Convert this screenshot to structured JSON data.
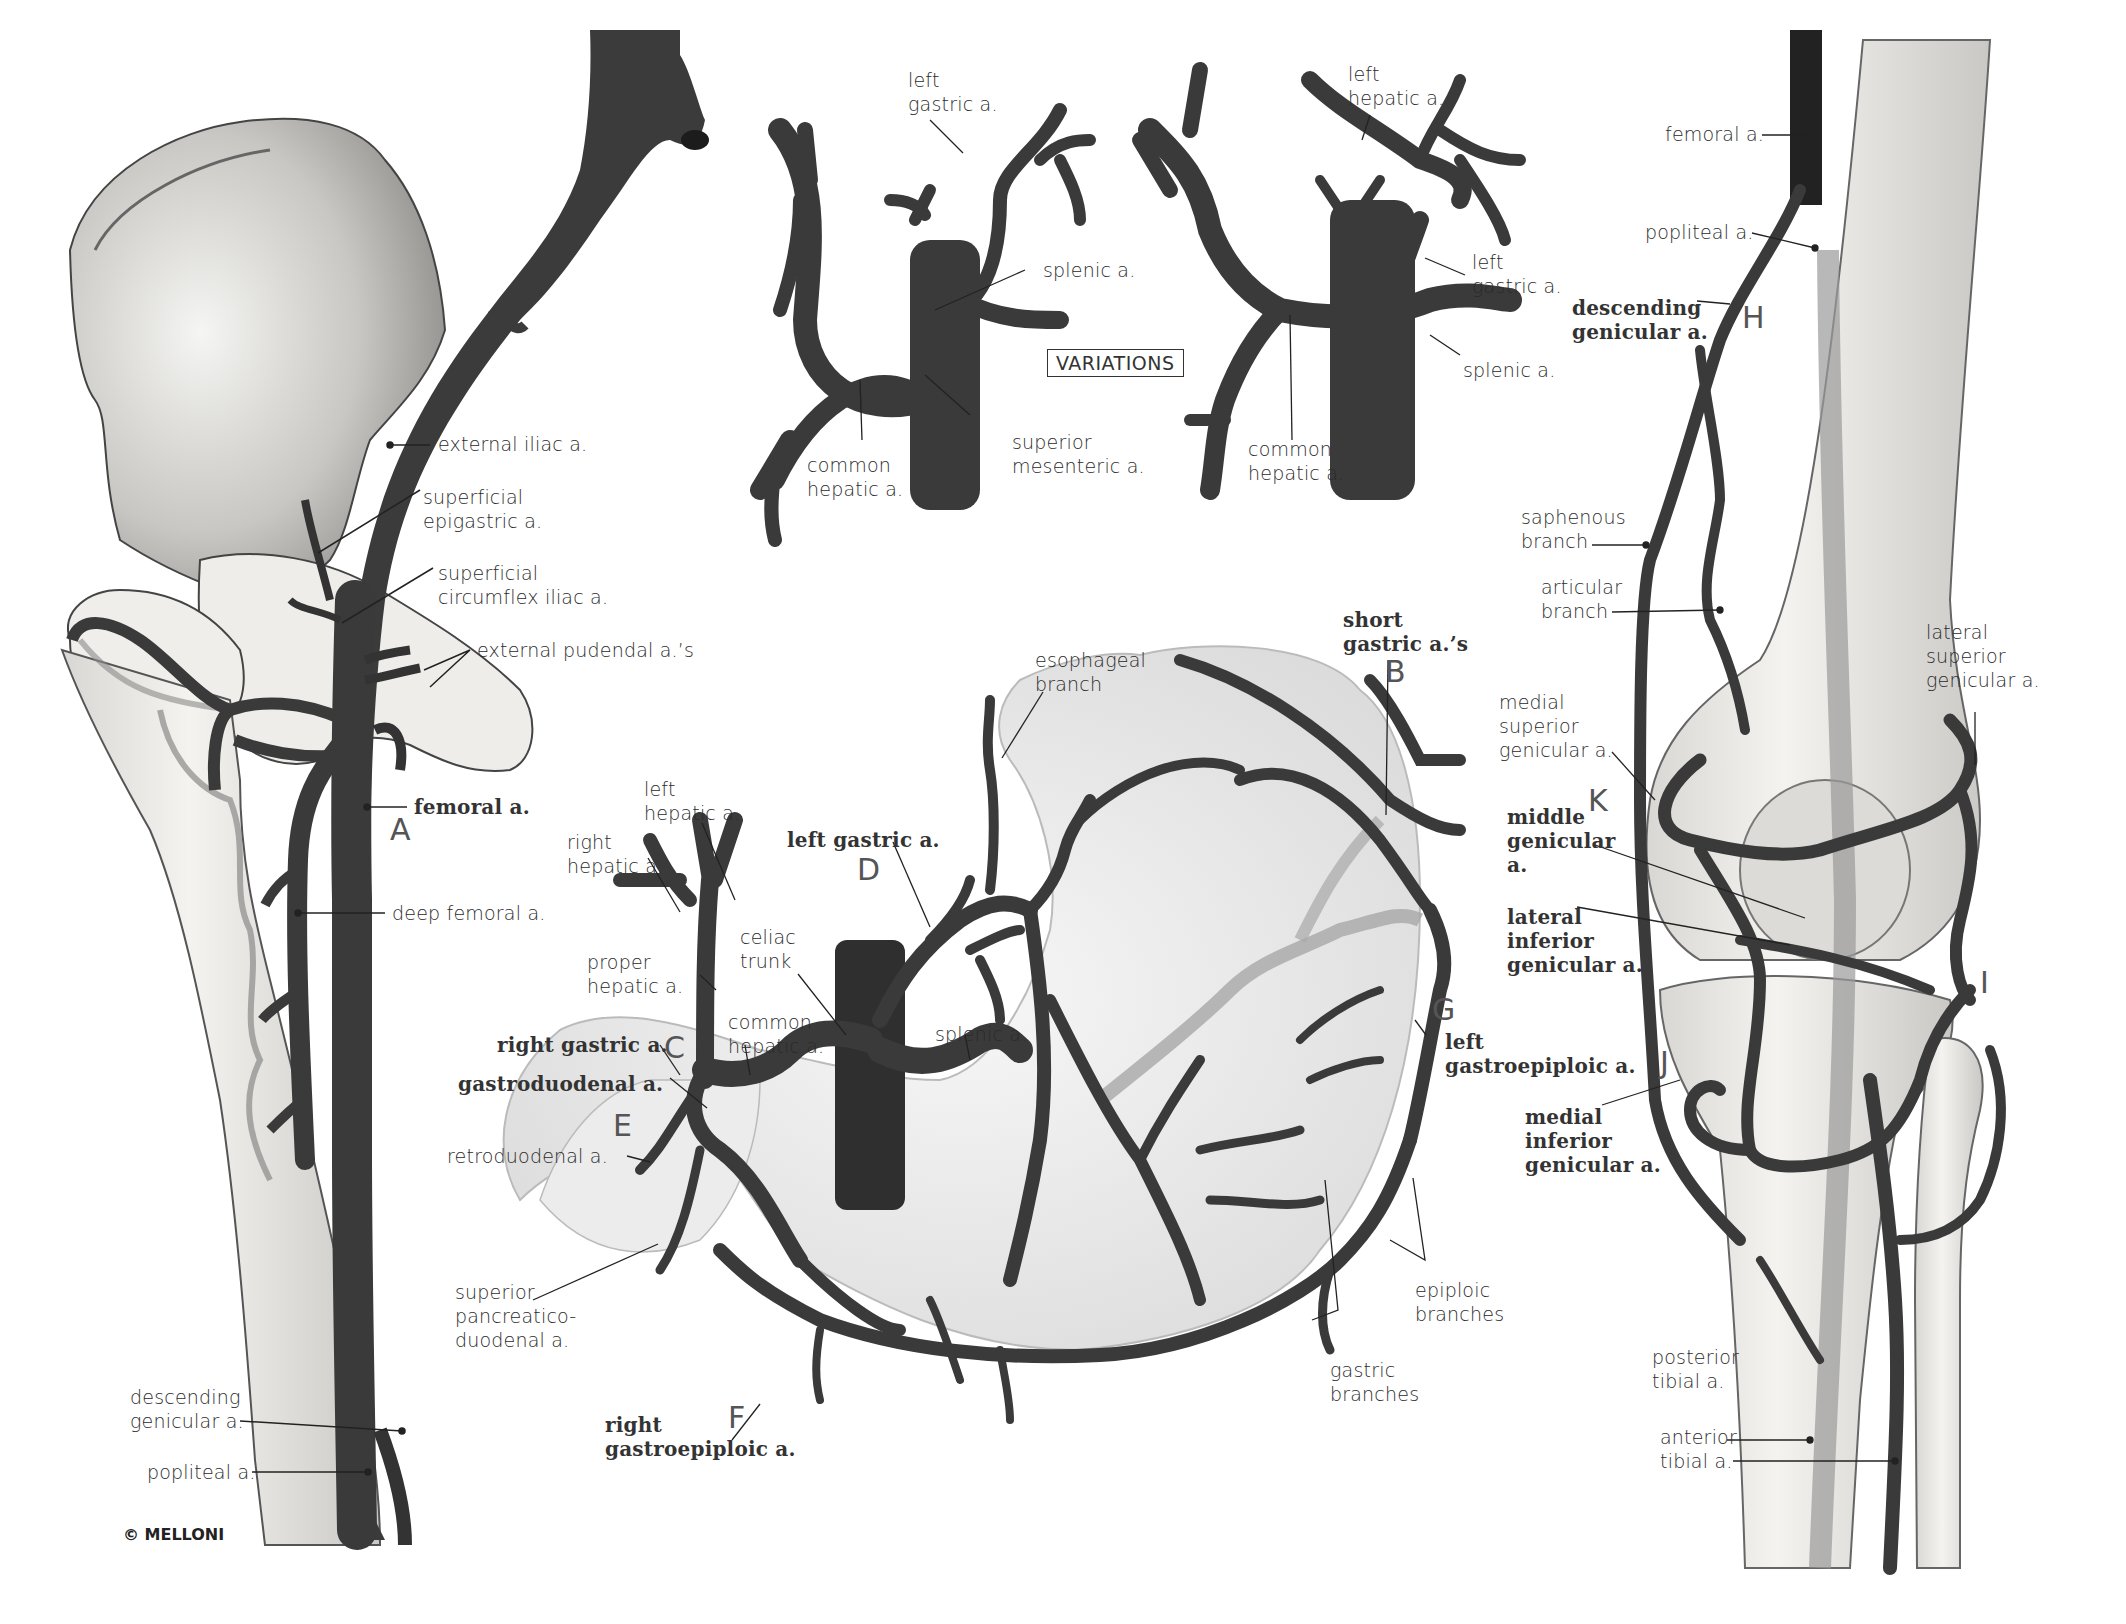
{
  "figure": {
    "copyright": "© MELLONI",
    "variations_label": "VARIATIONS",
    "colors": {
      "artery": "#3d3d3d",
      "artery_dark": "#262626",
      "bone": "#ecebe8",
      "bone_shade": "#b9b8b4",
      "organ": "#eeeeee",
      "faint_vessel": "#a8a8a8",
      "leader_line": "#222222",
      "text": "#2b2b2b",
      "letter": "#555555"
    }
  },
  "panels": {
    "hip_thigh": {
      "labels": {
        "external_iliac": "external iliac a.",
        "superficial_epigastric": "superficial\nepigastric a.",
        "superficial_circumflex_iliac": "superficial\ncircumflex iliac a.",
        "external_pudendal": "external pudendal a.’s",
        "femoral": "femoral a.",
        "deep_femoral": "deep femoral a.",
        "descending_genicular": "descending\ngenicular a.",
        "popliteal": "popliteal a."
      },
      "letters": {
        "A": "A"
      }
    },
    "variations": {
      "left_diagram": {
        "left_gastric": "left\ngastric a.",
        "splenic": "splenic a.",
        "common_hepatic": "common\nhepatic a.",
        "superior_mesenteric": "superior\nmesenteric a."
      },
      "right_diagram": {
        "left_hepatic": "left\nhepatic a.",
        "left_gastric": "left\ngastric a.",
        "splenic": "splenic a.",
        "common_hepatic": "common\nhepatic a."
      }
    },
    "stomach": {
      "labels": {
        "esophageal_branch": "esophageal\nbranch",
        "short_gastric": "short\ngastric a.’s",
        "left_hepatic": "left\nhepatic a.",
        "right_hepatic": "right\nhepatic a.",
        "left_gastric": "left gastric a.",
        "proper_hepatic": "proper\nhepatic a.",
        "celiac_trunk": "celiac\ntrunk",
        "common_hepatic": "common\nhepatic a.",
        "splenic": "splenic a.",
        "right_gastric": "right gastric a.",
        "gastroduodenal": "gastroduodenal a.",
        "retroduodenal": "retroduodenal a.",
        "left_gastroepiploic": "left\ngastroepiploic a.",
        "superior_pancreaticoduodenal": "superior\npancreatico-\nduodenal a.",
        "right_gastroepiploic": "right\ngastroepiploic a.",
        "epiploic_branches": "epiploic\nbranches",
        "gastric_branches": "gastric\nbranches"
      },
      "letters": {
        "B": "B",
        "C": "C",
        "D": "D",
        "E": "E",
        "F": "F",
        "G": "G"
      }
    },
    "knee": {
      "labels": {
        "femoral": "femoral a.",
        "popliteal": "popliteal a.",
        "descending_genicular": "descending\ngenicular a.",
        "saphenous_branch": "saphenous\nbranch",
        "articular_branch": "articular\nbranch",
        "lateral_superior_genicular": "lateral\nsuperior\ngenicular a.",
        "medial_superior_genicular": "medial\nsuperior\ngenicular a.",
        "middle_genicular": "middle\ngenicular\na.",
        "lateral_inferior_genicular": "lateral\ninferior\ngenicular a.",
        "medial_inferior_genicular": "medial\ninferior\ngenicular a.",
        "posterior_tibial": "posterior\ntibial a.",
        "anterior_tibial": "anterior\ntibial a."
      },
      "letters": {
        "H": "H",
        "I": "I",
        "J": "J",
        "K": "K"
      }
    }
  }
}
